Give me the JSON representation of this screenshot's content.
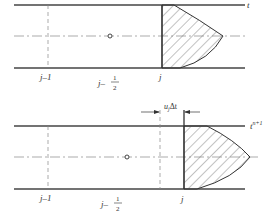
{
  "panels": [
    {
      "time_label": "t",
      "time_sup": "",
      "labels": {
        "j_minus_1": "j–1",
        "j_minus_half_prefix": "j–",
        "half_num": "1",
        "half_den": "2",
        "j": "j"
      }
    },
    {
      "time_label": "t",
      "time_sup": "n+1",
      "labels": {
        "j_minus_1": "j–1",
        "j_minus_half_prefix": "j–",
        "half_num": "1",
        "half_den": "2",
        "j": "j"
      },
      "displacement_label": "u",
      "displacement_sub": "j",
      "displacement_suffix": "Δt"
    }
  ]
}
